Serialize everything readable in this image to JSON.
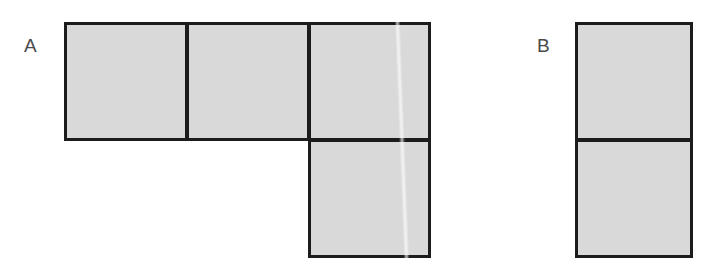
{
  "figure": {
    "width": 707,
    "height": 274,
    "background_color": "#ffffff",
    "cell_fill_color": "#d9d9d9",
    "cell_border_color": "#1c1c1c",
    "cell_border_width": 3,
    "label_color": "#4a4a4a",
    "cell_size": 118
  },
  "shapes": [
    {
      "label": "A",
      "label_x": 24,
      "label_y": 36,
      "description": "L-shaped tetromino made of four unit squares",
      "cell_count": 4,
      "cells": [
        {
          "name": "a-cell-top-left",
          "x": 64,
          "y": 22,
          "w": 124,
          "h": 119
        },
        {
          "name": "a-cell-top-middle",
          "x": 186,
          "y": 22,
          "w": 124,
          "h": 119
        },
        {
          "name": "a-cell-top-right",
          "x": 308,
          "y": 22,
          "w": 123,
          "h": 119
        },
        {
          "name": "a-cell-bottom",
          "x": 308,
          "y": 139,
          "w": 123,
          "h": 119
        }
      ],
      "artifact": {
        "x": 399,
        "y": 22,
        "w": 6,
        "h": 236
      }
    },
    {
      "label": "B",
      "label_x": 537,
      "label_y": 36,
      "description": "Vertical domino made of two unit squares",
      "cell_count": 2,
      "cells": [
        {
          "name": "b-cell-top",
          "x": 575,
          "y": 22,
          "w": 118,
          "h": 119
        },
        {
          "name": "b-cell-bottom",
          "x": 575,
          "y": 139,
          "w": 118,
          "h": 119
        }
      ],
      "artifact": null
    }
  ]
}
